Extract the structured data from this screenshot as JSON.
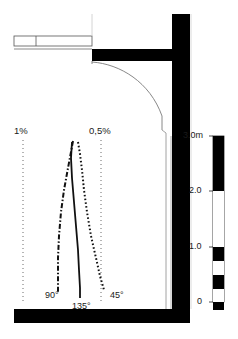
{
  "diagram": {
    "type": "architectural-section",
    "background_color": "#ffffff",
    "structure_color": "#000000",
    "line_color": "#1a1a1a",
    "thin_line_color": "#808080"
  },
  "percent_labels": [
    {
      "id": "one-percent",
      "text": "1%",
      "x": 14,
      "y": 126
    },
    {
      "id": "half-percent",
      "text": "0,5%",
      "x": 89,
      "y": 126
    }
  ],
  "angle_labels": [
    {
      "id": "angle-90",
      "text": "90°",
      "x": 45,
      "y": 291
    },
    {
      "id": "angle-135",
      "text": "135°",
      "x": 72,
      "y": 302
    },
    {
      "id": "angle-45",
      "text": "45°",
      "x": 110,
      "y": 291
    }
  ],
  "scale_bar": {
    "unit_label": "3.0m",
    "ticks": [
      {
        "label": "3.0m",
        "value": 3.0,
        "y": 136
      },
      {
        "label": "2.0",
        "value": 2.0,
        "y": 191
      },
      {
        "label": "1.0",
        "value": 1.0,
        "y": 247
      },
      {
        "label": "0",
        "value": 0,
        "y": 302
      }
    ],
    "segments": [
      {
        "from": 3.0,
        "to": 2.0,
        "fill": "#000000"
      },
      {
        "from": 2.0,
        "to": 1.0,
        "fill": "#ffffff"
      },
      {
        "from": 1.0,
        "to": 0.75,
        "fill": "#000000"
      },
      {
        "from": 0.75,
        "to": 0.5,
        "fill": "#ffffff"
      },
      {
        "from": 0.5,
        "to": 0.25,
        "fill": "#000000"
      },
      {
        "from": 0.25,
        "to": 0.0,
        "fill": "#ffffff"
      },
      {
        "from": 0.0,
        "to": -0.12,
        "fill": "#000000"
      }
    ]
  },
  "curves": [
    {
      "id": "curve-90",
      "label": "90°",
      "style": "dash-dot",
      "points": "73,141 71,152 68,168 64,190 61,212 59,236 58,258 58,276 58,292"
    },
    {
      "id": "curve-135",
      "label": "135°",
      "style": "solid",
      "points": "72,142 71,158 72,178 74,202 76,226 78,250 79,270 80,288 80,298"
    },
    {
      "id": "curve-45",
      "label": "45°",
      "style": "dotted",
      "points": "78,142 80,154 82,170 84,190 87,212 91,236 96,258 100,276 104,290"
    }
  ],
  "reference_lines": [
    {
      "id": "ref-1-percent",
      "x": 23,
      "y1": 140,
      "y2": 302
    },
    {
      "id": "ref-half-percent",
      "x": 101,
      "y1": 140,
      "y2": 302
    }
  ]
}
